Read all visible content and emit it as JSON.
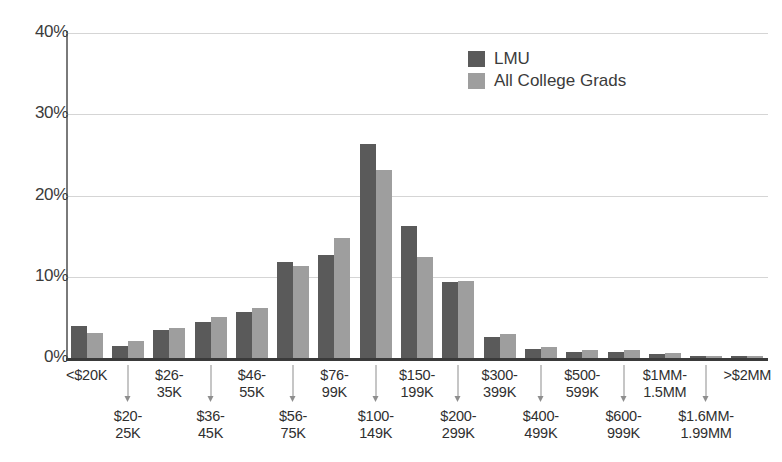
{
  "chart_data": {
    "type": "bar",
    "title": "",
    "xlabel": "",
    "ylabel": "",
    "ylim": [
      0,
      40
    ],
    "yticks": [
      "0%",
      "10%",
      "20%",
      "30%",
      "40%"
    ],
    "ytick_values": [
      0,
      10,
      20,
      30,
      40
    ],
    "grid": true,
    "legend_position": "top-right",
    "categories": [
      "<$20K",
      "$20-25K",
      "$26-35K",
      "$36-45K",
      "$46-55K",
      "$56-75K",
      "$76-99K",
      "$100-149K",
      "$150-199K",
      "$200-299K",
      "$300-399K",
      "$400-499K",
      "$500-599K",
      "$600-999K",
      "$1MM-1.5MM",
      "$1.6MM-1.99MM",
      ">$2MM"
    ],
    "category_lines": [
      [
        "<$20K"
      ],
      [
        "$20-",
        "25K"
      ],
      [
        "$26-",
        "35K"
      ],
      [
        "$36-",
        "45K"
      ],
      [
        "$46-",
        "55K"
      ],
      [
        "$56-",
        "75K"
      ],
      [
        "$76-",
        "99K"
      ],
      [
        "$100-",
        "149K"
      ],
      [
        "$150-",
        "199K"
      ],
      [
        "$200-",
        "299K"
      ],
      [
        "$300-",
        "399K"
      ],
      [
        "$400-",
        "499K"
      ],
      [
        "$500-",
        "599K"
      ],
      [
        "$600-",
        "999K"
      ],
      [
        "$1MM-",
        "1.5MM"
      ],
      [
        "$1.6MM-",
        "1.99MM"
      ],
      [
        ">$2MM"
      ]
    ],
    "category_label_row": [
      "top",
      "bottom",
      "top",
      "bottom",
      "top",
      "bottom",
      "top",
      "bottom",
      "top",
      "bottom",
      "top",
      "bottom",
      "top",
      "bottom",
      "top",
      "bottom",
      "top"
    ],
    "series": [
      {
        "name": "LMU",
        "color": "#5a5a5a",
        "values": [
          4.0,
          1.5,
          3.5,
          4.4,
          5.7,
          11.8,
          12.7,
          26.3,
          16.3,
          9.3,
          2.6,
          1.1,
          0.8,
          0.7,
          0.5,
          0.2,
          0.2
        ]
      },
      {
        "name": "All College Grads",
        "color": "#9e9e9e",
        "values": [
          3.1,
          2.1,
          3.7,
          5.0,
          6.1,
          11.3,
          14.8,
          23.1,
          12.4,
          9.5,
          2.9,
          1.4,
          1.0,
          1.0,
          0.6,
          0.3,
          0.3
        ]
      }
    ]
  },
  "legend": {
    "items": [
      {
        "label": "LMU",
        "color": "#5a5a5a"
      },
      {
        "label": "All College Grads",
        "color": "#9e9e9e"
      }
    ]
  },
  "colors": {
    "lmu": "#5a5a5a",
    "all_college_grads": "#9e9e9e",
    "gridline": "#d5d5d5",
    "axis": "#7a7a7a",
    "baseline": "#3a3a3a",
    "text": "#3b3b3b"
  }
}
